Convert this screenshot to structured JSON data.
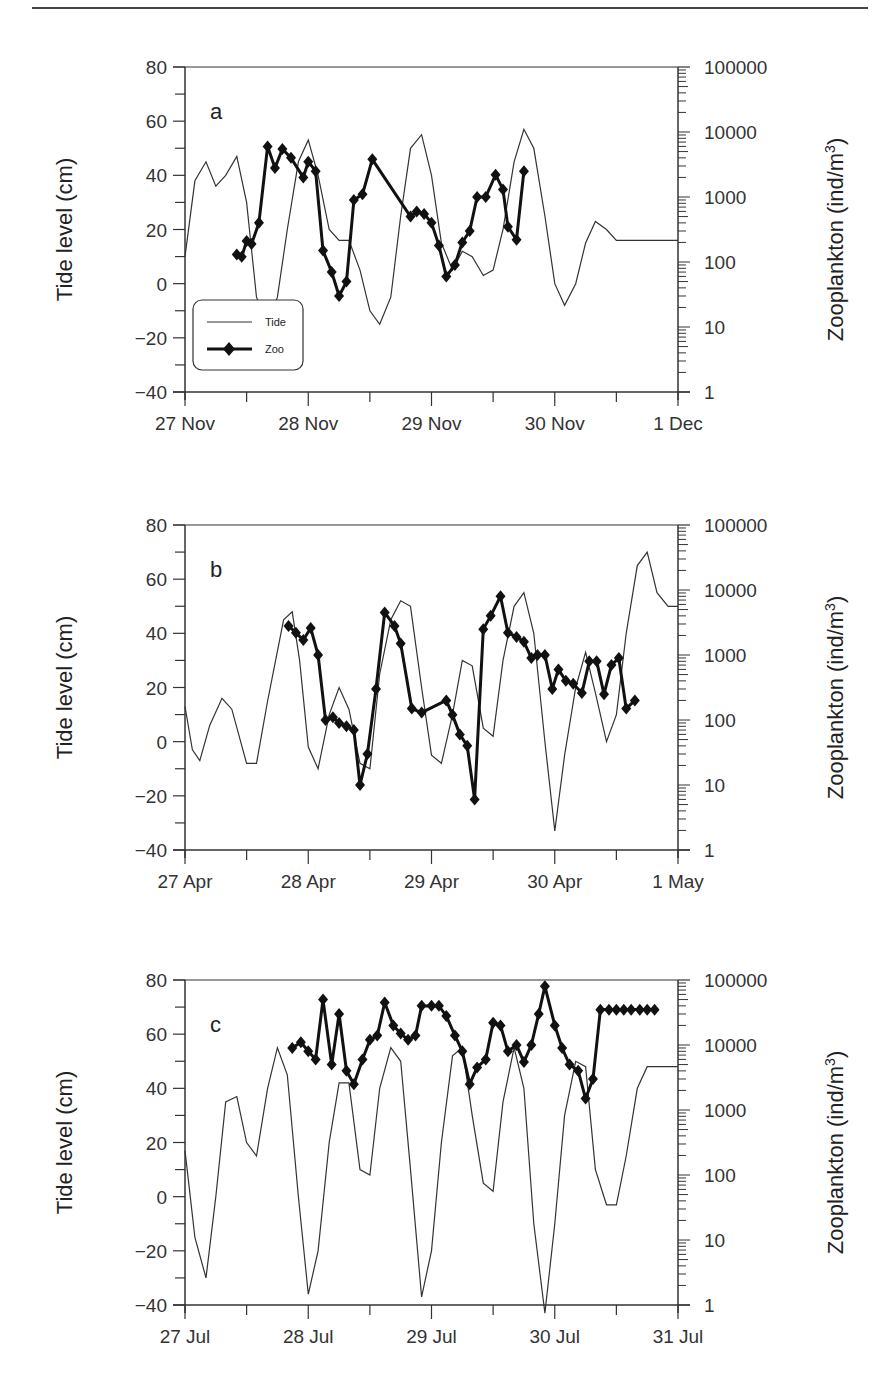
{
  "chart_data": [
    {
      "type": "line",
      "panel": "a",
      "xlabel": "",
      "ylabel": "Tide level (cm)",
      "y2label": "Zooplankton (ind/m3)",
      "ylim": [
        -40,
        80
      ],
      "y2lim": [
        1,
        100000
      ],
      "y2scale": "log",
      "x_ticks": [
        "27 Nov",
        "28 Nov",
        "29 Nov",
        "30 Nov",
        "1 Dec"
      ],
      "y_ticks": [
        -40,
        -20,
        0,
        20,
        40,
        60,
        80
      ],
      "y2_ticks": [
        "1",
        "10",
        "100",
        "1000",
        "10000",
        "100000"
      ],
      "legend": [
        "Tide",
        "Zoo"
      ],
      "series": [
        {
          "name": "Tide",
          "x_days": [
            0,
            0.08,
            0.17,
            0.25,
            0.33,
            0.42,
            0.5,
            0.58,
            0.67,
            0.75,
            0.83,
            0.92,
            1.0,
            1.08,
            1.17,
            1.25,
            1.33,
            1.42,
            1.5,
            1.58,
            1.67,
            1.75,
            1.83,
            1.92,
            2.0,
            2.08,
            2.17,
            2.25,
            2.33,
            2.42,
            2.5,
            2.58,
            2.67,
            2.75,
            2.83,
            2.92,
            3.0,
            3.08,
            3.17,
            3.25,
            3.33,
            3.42,
            3.5,
            3.58,
            3.67,
            3.75,
            3.83,
            3.92,
            4.0
          ],
          "values": [
            10,
            38,
            45,
            36,
            40,
            47,
            30,
            -5,
            -15,
            -5,
            20,
            45,
            53,
            40,
            20,
            16,
            16,
            5,
            -10,
            -15,
            -5,
            25,
            50,
            55,
            40,
            15,
            5,
            12,
            10,
            3,
            5,
            20,
            45,
            57,
            50,
            25,
            0,
            -8,
            0,
            15,
            23,
            20,
            16,
            16,
            16,
            16,
            16,
            16,
            16
          ]
        },
        {
          "name": "Zoo",
          "x_days": [
            0.42,
            0.46,
            0.5,
            0.54,
            0.6,
            0.67,
            0.73,
            0.79,
            0.86,
            0.96,
            1.0,
            1.06,
            1.12,
            1.19,
            1.25,
            1.31,
            1.37,
            1.44,
            1.52,
            1.83,
            1.88,
            1.94,
            2.0,
            2.06,
            2.12,
            2.19,
            2.25,
            2.31,
            2.37,
            2.44,
            2.52,
            2.58,
            2.62,
            2.69,
            2.75
          ],
          "values": [
            130,
            120,
            210,
            190,
            400,
            6000,
            2800,
            5500,
            4000,
            2000,
            3500,
            2500,
            150,
            70,
            30,
            50,
            900,
            1100,
            3800,
            500,
            600,
            550,
            400,
            180,
            60,
            90,
            200,
            300,
            1000,
            1000,
            2200,
            1300,
            350,
            220,
            2500
          ]
        }
      ]
    },
    {
      "type": "line",
      "panel": "b",
      "xlabel": "",
      "ylabel": "Tide level (cm)",
      "y2label": "Zooplankton (ind/m3)",
      "ylim": [
        -40,
        80
      ],
      "y2lim": [
        1,
        100000
      ],
      "y2scale": "log",
      "x_ticks": [
        "27 Apr",
        "28 Apr",
        "29 Apr",
        "30 Apr",
        "1 May"
      ],
      "y_ticks": [
        -40,
        -20,
        0,
        20,
        40,
        60,
        80
      ],
      "y2_ticks": [
        "1",
        "10",
        "100",
        "1000",
        "10000",
        "100000"
      ],
      "series": [
        {
          "name": "Tide",
          "x_days": [
            0,
            0.06,
            0.12,
            0.2,
            0.3,
            0.38,
            0.5,
            0.58,
            0.67,
            0.8,
            0.87,
            0.93,
            1.0,
            1.08,
            1.17,
            1.25,
            1.33,
            1.42,
            1.5,
            1.58,
            1.67,
            1.75,
            1.83,
            1.92,
            2.0,
            2.08,
            2.17,
            2.25,
            2.33,
            2.42,
            2.5,
            2.58,
            2.67,
            2.75,
            2.83,
            2.92,
            3.0,
            3.08,
            3.17,
            3.25,
            3.33,
            3.42,
            3.5,
            3.58,
            3.67,
            3.75,
            3.83,
            3.92,
            4.0
          ],
          "values": [
            13,
            -3,
            -7,
            6,
            16,
            12,
            -8,
            -8,
            15,
            45,
            48,
            30,
            -2,
            -10,
            10,
            20,
            12,
            -8,
            -10,
            25,
            45,
            52,
            50,
            20,
            -5,
            -8,
            10,
            30,
            28,
            5,
            2,
            30,
            50,
            55,
            40,
            0,
            -33,
            -5,
            20,
            33,
            18,
            0,
            10,
            40,
            65,
            70,
            55,
            50,
            50
          ]
        },
        {
          "name": "Zoo",
          "x_days": [
            0.84,
            0.9,
            0.96,
            1.02,
            1.08,
            1.14,
            1.2,
            1.25,
            1.31,
            1.37,
            1.42,
            1.48,
            1.55,
            1.62,
            1.7,
            1.75,
            1.84,
            1.92,
            2.12,
            2.17,
            2.23,
            2.29,
            2.35,
            2.42,
            2.48,
            2.56,
            2.62,
            2.69,
            2.75,
            2.81,
            2.86,
            2.92,
            2.98,
            3.03,
            3.09,
            3.15,
            3.22,
            3.28,
            3.34,
            3.4,
            3.46,
            3.52,
            3.58,
            3.65
          ],
          "values": [
            2800,
            2200,
            1700,
            2600,
            1000,
            100,
            110,
            90,
            80,
            70,
            10,
            30,
            300,
            4500,
            2800,
            1500,
            150,
            130,
            200,
            120,
            60,
            40,
            6,
            2500,
            4000,
            8000,
            2200,
            1900,
            1600,
            900,
            1000,
            1000,
            300,
            600,
            400,
            360,
            260,
            800,
            800,
            250,
            700,
            900,
            150,
            200
          ]
        }
      ]
    },
    {
      "type": "line",
      "panel": "c",
      "xlabel": "",
      "ylabel": "Tide level (cm)",
      "y2label": "Zooplankton (ind/m3)",
      "ylim": [
        -40,
        80
      ],
      "y2lim": [
        1,
        100000
      ],
      "y2scale": "log",
      "x_ticks": [
        "27 Jul",
        "28 Jul",
        "29 Jul",
        "30 Jul",
        "31 Jul"
      ],
      "y_ticks": [
        -40,
        -20,
        0,
        20,
        40,
        60,
        80
      ],
      "y2_ticks": [
        "1",
        "10",
        "100",
        "1000",
        "10000",
        "100000"
      ],
      "series": [
        {
          "name": "Tide",
          "x_days": [
            0,
            0.08,
            0.17,
            0.25,
            0.33,
            0.42,
            0.5,
            0.58,
            0.67,
            0.75,
            0.83,
            0.92,
            1.0,
            1.08,
            1.17,
            1.25,
            1.33,
            1.42,
            1.5,
            1.58,
            1.67,
            1.75,
            1.83,
            1.92,
            2.0,
            2.08,
            2.17,
            2.25,
            2.33,
            2.42,
            2.5,
            2.58,
            2.67,
            2.75,
            2.83,
            2.92,
            3.0,
            3.08,
            3.17,
            3.25,
            3.33,
            3.42,
            3.5,
            3.58,
            3.67,
            3.75,
            3.83,
            3.92,
            4.0
          ],
          "values": [
            17,
            -15,
            -30,
            0,
            35,
            37,
            20,
            15,
            40,
            55,
            45,
            0,
            -36,
            -20,
            20,
            42,
            42,
            10,
            8,
            40,
            55,
            50,
            10,
            -37,
            -20,
            20,
            52,
            55,
            30,
            5,
            2,
            35,
            55,
            40,
            -10,
            -43,
            -10,
            30,
            50,
            48,
            10,
            -3,
            -3,
            15,
            40,
            48,
            48,
            48,
            48
          ]
        },
        {
          "name": "Zoo",
          "x_days": [
            0.87,
            0.94,
            1.0,
            1.06,
            1.12,
            1.19,
            1.25,
            1.31,
            1.37,
            1.44,
            1.5,
            1.56,
            1.62,
            1.69,
            1.75,
            1.81,
            1.87,
            1.92,
            2.0,
            2.06,
            2.12,
            2.19,
            2.25,
            2.31,
            2.37,
            2.44,
            2.5,
            2.56,
            2.62,
            2.69,
            2.75,
            2.81,
            2.87,
            2.92,
            3.0,
            3.06,
            3.12,
            3.19,
            3.25,
            3.31,
            3.37,
            3.44,
            3.5,
            3.56,
            3.62,
            3.69,
            3.75,
            3.81
          ],
          "values": [
            9000,
            11000,
            8000,
            6000,
            50000,
            5000,
            30000,
            4000,
            2500,
            6000,
            12000,
            14000,
            45000,
            20000,
            15000,
            12000,
            14000,
            40000,
            40000,
            40000,
            28000,
            14000,
            8000,
            2500,
            4500,
            6000,
            22000,
            20000,
            8000,
            10000,
            5500,
            10000,
            30000,
            80000,
            20000,
            9000,
            5000,
            4000,
            1500,
            3000,
            35000,
            35000,
            35000,
            35000,
            35000,
            35000,
            35000,
            35000
          ]
        }
      ]
    }
  ],
  "figure": {
    "panels": [
      {
        "letter": "a",
        "x_ticks": [
          "27 Nov",
          "28 Nov",
          "29 Nov",
          "30 Nov",
          "1 Dec"
        ]
      },
      {
        "letter": "b",
        "x_ticks": [
          "27 Apr",
          "28 Apr",
          "29 Apr",
          "30 Apr",
          "1 May"
        ]
      },
      {
        "letter": "c",
        "x_ticks": [
          "27 Jul",
          "28 Jul",
          "29 Jul",
          "30 Jul",
          "31 Jul"
        ]
      }
    ],
    "ylabel": "Tide level (cm)",
    "y2label_main": "Zooplankton (ind/m",
    "y2label_sup": "3",
    "y2label_close": ")",
    "y_ticks": [
      "80",
      "60",
      "40",
      "20",
      "0",
      "−20",
      "−40"
    ],
    "y2_ticks": [
      "100000",
      "10000",
      "1000",
      "100",
      "10",
      "1"
    ],
    "legend": {
      "tide": "Tide",
      "zoo": "Zoo"
    }
  }
}
